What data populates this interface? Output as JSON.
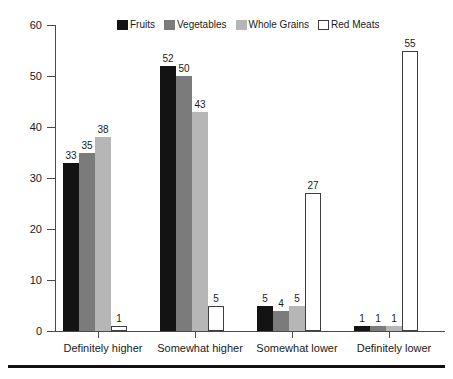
{
  "chart_data": {
    "type": "bar",
    "title": "",
    "subtitle": "",
    "xlabel": "",
    "ylabel": "",
    "categories": [
      "Definitely higher",
      "Somewhat higher",
      "Somewhat lower",
      "Definitely lower"
    ],
    "series": [
      {
        "name": "Fruits",
        "color": "#131313",
        "values": [
          33,
          52,
          5,
          1
        ]
      },
      {
        "name": "Vegetables",
        "color": "#7b7b7b",
        "values": [
          35,
          50,
          4,
          1
        ]
      },
      {
        "name": "Whole Grains",
        "color": "#b6b6b6",
        "values": [
          38,
          43,
          5,
          1
        ]
      },
      {
        "name": "Red Meats",
        "color": "#ffffff",
        "values": [
          1,
          5,
          27,
          55
        ]
      }
    ],
    "ylim": [
      0,
      60
    ],
    "yticks": [
      0,
      10,
      20,
      30,
      40,
      50,
      60
    ],
    "ytick_labels": [
      "0",
      "10",
      "20",
      "30",
      "40",
      "50",
      "60"
    ],
    "grid": false,
    "legend_position": "top-center",
    "show_value_labels": true,
    "axis_color": "#4a4a4a",
    "text_color": "#1a1a1a",
    "background": "#ffffff",
    "rule_color": "#111111"
  }
}
